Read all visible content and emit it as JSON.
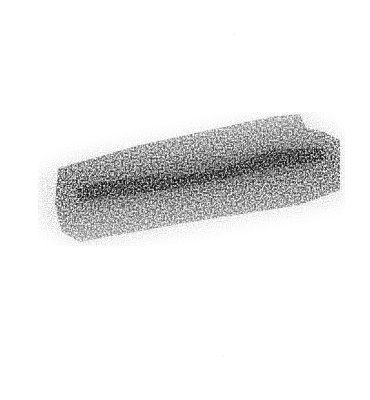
{
  "image": {
    "subject": "charcoal brush stroke",
    "background_color": "#ffffff",
    "stroke_color": "#1a1a1a",
    "core_color": "#0d0d0d",
    "stroke": {
      "left_x": 38,
      "right_x": 345,
      "top_left_y": 160,
      "bottom_left_y": 242,
      "top_right_y": 112,
      "bottom_right_y": 205,
      "angle_deg": -12
    },
    "specks": [
      {
        "x": 233,
        "y": 33
      },
      {
        "x": 222,
        "y": 355
      }
    ]
  }
}
